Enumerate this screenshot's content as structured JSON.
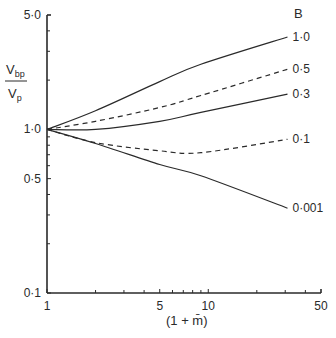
{
  "chart_data": {
    "type": "line",
    "title": "",
    "xlabel": "(1 + m̄)",
    "ylabel_numerator": "V_bp",
    "ylabel_denominator": "V_p",
    "xscale": "log",
    "yscale": "log",
    "xlim": [
      1,
      50
    ],
    "ylim": [
      0.1,
      5.0
    ],
    "x_ticks": [
      {
        "value": 1,
        "label": "1"
      },
      {
        "value": 5,
        "label": "5"
      },
      {
        "value": 10,
        "label": "10"
      },
      {
        "value": 50,
        "label": "50"
      }
    ],
    "x_minor_ticks": [
      2,
      3,
      4,
      6,
      7,
      8,
      9,
      20,
      30,
      40
    ],
    "y_ticks": [
      {
        "value": 5.0,
        "label": "5·0"
      },
      {
        "value": 1.0,
        "label": "1·0"
      },
      {
        "value": 0.5,
        "label": "0·5"
      },
      {
        "value": 0.1,
        "label": "0·1"
      }
    ],
    "y_minor_ticks": [
      0.2,
      0.3,
      0.4,
      0.6,
      0.7,
      0.8,
      0.9,
      2,
      3,
      4
    ],
    "grid": false,
    "legend_title": "B",
    "legend_position": "right-inline",
    "series": [
      {
        "name": "1·0",
        "B": 1.0,
        "style": "solid",
        "x": [
          1,
          2,
          5,
          9,
          31
        ],
        "y": [
          1.0,
          1.3,
          1.96,
          2.5,
          3.67
        ]
      },
      {
        "name": "0·5",
        "B": 0.5,
        "style": "dashed",
        "x": [
          1,
          2,
          5,
          9,
          31
        ],
        "y": [
          1.0,
          1.12,
          1.36,
          1.61,
          2.33
        ]
      },
      {
        "name": "0·3",
        "B": 0.3,
        "style": "solid",
        "x": [
          1,
          2,
          5,
          9,
          31
        ],
        "y": [
          1.0,
          1.0,
          1.12,
          1.27,
          1.64
        ]
      },
      {
        "name": "0·1",
        "B": 0.1,
        "style": "dashed",
        "x": [
          1,
          2,
          5,
          9,
          31
        ],
        "y": [
          1.0,
          0.83,
          0.74,
          0.72,
          0.87
        ]
      },
      {
        "name": "0·001",
        "B": 0.001,
        "style": "solid",
        "x": [
          1,
          2,
          5,
          9,
          31
        ],
        "y": [
          1.0,
          0.82,
          0.61,
          0.52,
          0.33
        ]
      }
    ]
  }
}
